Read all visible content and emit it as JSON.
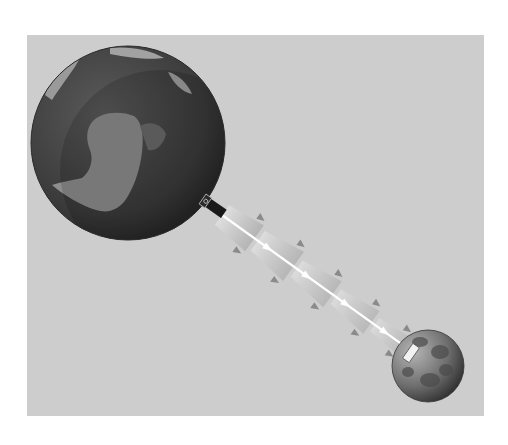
{
  "figure": {
    "background_color": "#cdcdcd",
    "page_color": "#ffffff",
    "earth": {
      "cx": 128,
      "cy": 143,
      "r": 97,
      "ocean_color": "#3c3c3c",
      "land_color": "#8f8f8f"
    },
    "moon": {
      "cx": 428,
      "cy": 366,
      "r": 36,
      "color": "#7a7a7a"
    },
    "beam": {
      "from": [
        222,
        215
      ],
      "to": [
        413,
        352
      ],
      "color": "#ffffff",
      "segments": 5
    },
    "laser_station": {
      "x": 214,
      "y": 205
    },
    "retroreflector": {
      "x": 410,
      "y": 352
    }
  }
}
